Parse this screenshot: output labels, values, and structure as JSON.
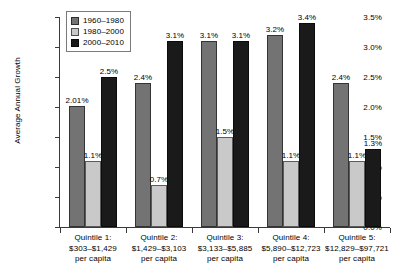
{
  "chart_data": {
    "type": "bar",
    "title": "",
    "subtitle": "",
    "xlabel": "",
    "ylabel": "Average Annual Growth",
    "ylim": [
      0,
      3.5
    ],
    "ytick_labels": [
      "0.0%",
      "0.5%",
      "1.0%",
      "1.5%",
      "2.0%",
      "2.5%",
      "3.0%",
      "3.5%"
    ],
    "ytick_values": [
      0,
      0.5,
      1.0,
      1.5,
      2.0,
      2.5,
      3.0,
      3.5
    ],
    "grid": false,
    "legend_position": "top-left-inside",
    "categories": [
      "Quintile 1:\n$303–$1,429\nper capita",
      "Quintile 2:\n$1,429–$3,103\nper capita",
      "Quintile 3:\n$3,133–$5,885\nper capita",
      "Quintile 4:\n$5,890–$12,723\nper capita",
      "Quintile 5:\n$12,829–$97,721\nper capita"
    ],
    "category_lines": [
      [
        "Quintile 1:",
        "$303–$1,429",
        "per capita"
      ],
      [
        "Quintile 2:",
        "$1,429–$3,103",
        "per capita"
      ],
      [
        "Quintile 3:",
        "$3,133–$5,885",
        "per capita"
      ],
      [
        "Quintile 4:",
        "$5,890–$12,723",
        "per capita"
      ],
      [
        "Quintile 5:",
        "$12,829–$97,721",
        "per capita"
      ]
    ],
    "series": [
      {
        "name": "1960–1980",
        "color": "#737373",
        "values": [
          2.01,
          2.4,
          3.1,
          3.2,
          2.4
        ],
        "labels": [
          "2.01%",
          "2.4%",
          "3.1%",
          "3.2%",
          "2.4%"
        ]
      },
      {
        "name": "1980–2000",
        "color": "#c9c9c9",
        "values": [
          1.1,
          0.7,
          1.5,
          1.1,
          1.1
        ],
        "labels": [
          "1.1%",
          "0.7%",
          "1.5%",
          "1.1%",
          "1.1%"
        ]
      },
      {
        "name": "2000–2010",
        "color": "#1a1a1a",
        "values": [
          2.5,
          3.1,
          3.1,
          3.4,
          1.3
        ],
        "labels": [
          "2.5%",
          "3.1%",
          "3.1%",
          "3.4%",
          "1.3%"
        ]
      }
    ]
  },
  "legend": {
    "items": [
      {
        "label": "1960–1980",
        "swatch": "#737373"
      },
      {
        "label": "1980–2000",
        "swatch": "#c9c9c9"
      },
      {
        "label": "2000–2010",
        "swatch": "#1a1a1a"
      }
    ]
  },
  "axis": {
    "y_title": "Average Annual Growth"
  }
}
